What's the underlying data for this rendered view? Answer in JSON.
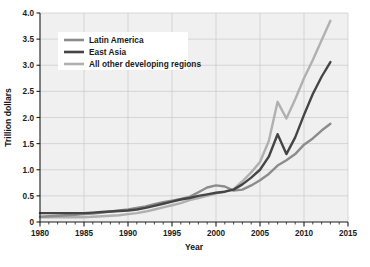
{
  "chart_data": {
    "type": "line",
    "title": "",
    "xlabel": "Year",
    "ylabel": "Trillion dollars",
    "xlim": [
      1980,
      2015
    ],
    "ylim": [
      0,
      4.0
    ],
    "xticks": [
      1980,
      1985,
      1990,
      1995,
      2000,
      2005,
      2010,
      2015
    ],
    "xticklabels": [
      "1980",
      "1985",
      "1990",
      "1995",
      "2000",
      "2005",
      "2010",
      "2015"
    ],
    "yticks": [
      0,
      0.5,
      1.0,
      1.5,
      2.0,
      2.5,
      3.0,
      3.5,
      4.0
    ],
    "yticklabels": [
      "0",
      "0.5",
      "1.0",
      "1.5",
      "2.0",
      "2.5",
      "3.0",
      "3.5",
      "4.0"
    ],
    "grid": true,
    "grid_color": "#c9c9c9",
    "plot_background": "#f0f0f0",
    "legend_position": "upper-left",
    "x": [
      1980,
      1981,
      1982,
      1983,
      1984,
      1985,
      1986,
      1987,
      1988,
      1989,
      1990,
      1991,
      1992,
      1993,
      1994,
      1995,
      1996,
      1997,
      1998,
      1999,
      2000,
      2001,
      2002,
      2003,
      2004,
      2005,
      2006,
      2007,
      2008,
      2009,
      2010,
      2011,
      2012,
      2013
    ],
    "series": [
      {
        "name": "Latin America",
        "color": "#8c8c8c",
        "values": [
          0.1,
          0.11,
          0.12,
          0.13,
          0.14,
          0.15,
          0.16,
          0.18,
          0.2,
          0.22,
          0.24,
          0.27,
          0.3,
          0.34,
          0.38,
          0.41,
          0.44,
          0.48,
          0.57,
          0.66,
          0.7,
          0.68,
          0.6,
          0.62,
          0.7,
          0.8,
          0.92,
          1.08,
          1.18,
          1.3,
          1.48,
          1.6,
          1.75,
          1.88
        ]
      },
      {
        "name": "East Asia",
        "color": "#454545",
        "values": [
          0.17,
          0.17,
          0.17,
          0.17,
          0.17,
          0.17,
          0.18,
          0.19,
          0.2,
          0.21,
          0.22,
          0.24,
          0.27,
          0.31,
          0.35,
          0.39,
          0.43,
          0.46,
          0.5,
          0.53,
          0.56,
          0.58,
          0.62,
          0.72,
          0.85,
          1.0,
          1.25,
          1.68,
          1.3,
          1.62,
          2.05,
          2.45,
          2.78,
          3.06
        ]
      },
      {
        "name": "All other developing regions",
        "color": "#b0b0b0",
        "values": [
          0.09,
          0.09,
          0.09,
          0.09,
          0.09,
          0.09,
          0.1,
          0.11,
          0.12,
          0.13,
          0.15,
          0.17,
          0.2,
          0.24,
          0.28,
          0.32,
          0.36,
          0.42,
          0.46,
          0.5,
          0.55,
          0.58,
          0.63,
          0.78,
          0.95,
          1.15,
          1.55,
          2.3,
          1.98,
          2.35,
          2.75,
          3.1,
          3.48,
          3.85
        ]
      }
    ]
  },
  "legend": {
    "items": [
      {
        "label": "Latin America"
      },
      {
        "label": "East Asia"
      },
      {
        "label": "All other developing regions"
      }
    ]
  }
}
